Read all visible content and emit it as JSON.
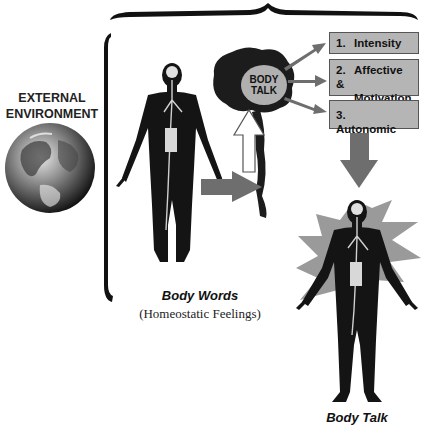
{
  "external_environment": {
    "line1": "EXTERNAL",
    "line2": "ENVIRONMENT",
    "icon": "earth-globe-icon"
  },
  "brain": {
    "label_line1": "BODY",
    "label_line2": "TALK"
  },
  "boxes": [
    {
      "num": "1.",
      "line1": "Intensity",
      "line2": ""
    },
    {
      "num": "2.",
      "line1": "Affective &",
      "line2": "Motivation"
    },
    {
      "num": "3.",
      "line1": "Autonomic",
      "line2": ""
    }
  ],
  "left_figure": {
    "caption": "Body Words",
    "subcaption": "(Homeostatic Feelings)"
  },
  "right_figure": {
    "caption": "Body Talk"
  },
  "colors": {
    "box_fill": "#b5b5b5",
    "arrow_fill": "#6e6e6e",
    "star_fill": "#9a9a9a",
    "figure": "#141414",
    "brain": "#1c1c1c",
    "ellipse": "#b0b0b0"
  }
}
